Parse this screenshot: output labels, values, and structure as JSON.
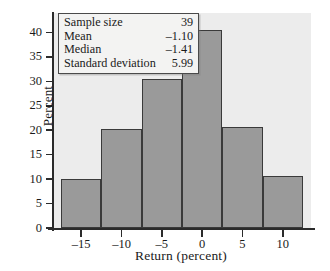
{
  "chart_data": {
    "type": "bar",
    "title": "",
    "subtitle": "",
    "xlabel": "Return (percent)",
    "ylabel": "Percent",
    "categories": [
      "-15",
      "-10",
      "-5",
      "0",
      "5",
      "10"
    ],
    "bin_centers": [
      -15,
      -10,
      -5,
      0,
      5,
      10
    ],
    "bin_edges": [
      -17.5,
      -12.5,
      -7.5,
      -2.5,
      2.5,
      7.5,
      12.5
    ],
    "bin_width": 5,
    "values": [
      10.1,
      20.3,
      30.4,
      40.5,
      20.6,
      10.7
    ],
    "xlim": [
      -18.5,
      13.5
    ],
    "ylim": [
      0,
      44
    ],
    "xticks": [
      -15,
      -10,
      -5,
      0,
      5,
      10
    ],
    "yticks": [
      0,
      5,
      10,
      15,
      20,
      25,
      30,
      35,
      40
    ],
    "xtick_labels": [
      "–15",
      "–10",
      "–5",
      "0",
      "5",
      "10"
    ],
    "ytick_labels": [
      "0",
      "5",
      "10",
      "15",
      "20",
      "25",
      "30",
      "35",
      "40"
    ],
    "grid": false,
    "legend": false,
    "bar_color": "#9a9a9a",
    "bar_edge_color": "#3a3a3a",
    "plot_background": "#ececec",
    "page_background": "#ffffff",
    "axis_color": "#2b2b2b"
  },
  "stats_box": {
    "rows": [
      {
        "label": "Sample size",
        "value": "39"
      },
      {
        "label": "Mean",
        "value": "–1.10"
      },
      {
        "label": "Median",
        "value": "–1.41"
      },
      {
        "label": "Standard deviation",
        "value": "5.99"
      }
    ]
  }
}
